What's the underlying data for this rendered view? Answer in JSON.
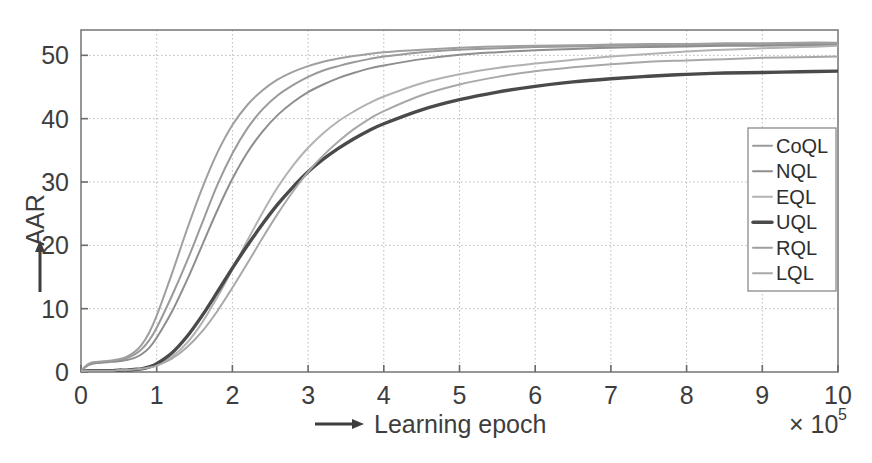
{
  "figure": {
    "title": "",
    "y_axis_label": "AAR",
    "x_axis_label": "Learning epoch",
    "x_multiplier_base": "× 10",
    "x_multiplier_exponent": "5",
    "arrow_y_icon": "up-arrow-icon",
    "arrow_x_icon": "right-arrow-icon"
  },
  "legend": {
    "position": "upper-right-inside",
    "entries": [
      {
        "label": "CoQL",
        "color": "#9a9a9a",
        "width": 2.0
      },
      {
        "label": "NQL",
        "color": "#8e8e8e",
        "width": 2.0
      },
      {
        "label": "EQL",
        "color": "#b2b2b2",
        "width": 2.0
      },
      {
        "label": "UQL",
        "color": "#4a4a4a",
        "width": 3.4
      },
      {
        "label": "RQL",
        "color": "#9f9f9f",
        "width": 2.0
      },
      {
        "label": "LQL",
        "color": "#a8a8a8",
        "width": 2.0
      }
    ]
  },
  "chart_data": {
    "type": "line",
    "title": "",
    "xlabel": "Learning epoch",
    "ylabel": "AAR",
    "xlim": [
      0,
      10
    ],
    "ylim": [
      0,
      54
    ],
    "xticks": [
      0,
      1,
      2,
      3,
      4,
      5,
      6,
      7,
      8,
      9,
      10
    ],
    "yticks": [
      0,
      10,
      20,
      30,
      40,
      50
    ],
    "xtick_labels": [
      "0",
      "1",
      "2",
      "3",
      "4",
      "5",
      "6",
      "7",
      "8",
      "9",
      "10"
    ],
    "ytick_labels": [
      "0",
      "10",
      "20",
      "30",
      "40",
      "50"
    ],
    "x_unit_multiplier": "x 10^5",
    "grid": true,
    "grid_style": "dotted",
    "legend_position": "upper right",
    "x": [
      0,
      0.1,
      0.2,
      0.3,
      0.4,
      0.5,
      0.6,
      0.7,
      0.8,
      0.9,
      1.0,
      1.2,
      1.4,
      1.6,
      1.8,
      2.0,
      2.2,
      2.4,
      2.6,
      2.8,
      3.0,
      3.2,
      3.4,
      3.6,
      3.8,
      4.0,
      4.5,
      5.0,
      5.5,
      6.0,
      6.5,
      7.0,
      7.5,
      8.0,
      8.5,
      9.0,
      9.5,
      10.0
    ],
    "series": [
      {
        "name": "CoQL",
        "color": "#9a9a9a",
        "values": [
          0.2,
          1.2,
          1.5,
          1.6,
          1.7,
          1.9,
          2.2,
          2.7,
          3.6,
          5.0,
          7.0,
          12.0,
          17.5,
          23.5,
          29.5,
          34.5,
          38.5,
          41.5,
          43.7,
          45.3,
          46.6,
          47.6,
          48.3,
          48.9,
          49.4,
          49.8,
          50.5,
          50.9,
          51.1,
          51.3,
          51.4,
          51.5,
          51.6,
          51.6,
          51.7,
          51.7,
          51.8,
          51.8
        ]
      },
      {
        "name": "NQL",
        "color": "#8e8e8e",
        "values": [
          0.2,
          1.1,
          1.4,
          1.5,
          1.6,
          1.7,
          1.9,
          2.2,
          2.8,
          3.8,
          5.4,
          9.5,
          14.5,
          20.0,
          25.5,
          30.5,
          34.7,
          38.0,
          40.6,
          42.6,
          44.2,
          45.4,
          46.4,
          47.2,
          47.9,
          48.4,
          49.4,
          50.1,
          50.5,
          50.8,
          51.0,
          51.2,
          51.3,
          51.4,
          51.5,
          51.5,
          51.6,
          51.6
        ]
      },
      {
        "name": "EQL",
        "color": "#b2b2b2",
        "values": [
          0.1,
          0.2,
          0.2,
          0.2,
          0.2,
          0.3,
          0.3,
          0.4,
          0.5,
          0.7,
          1.1,
          2.4,
          4.6,
          7.8,
          11.8,
          16.2,
          20.8,
          25.2,
          29.2,
          32.6,
          35.4,
          37.7,
          39.6,
          41.1,
          42.4,
          43.5,
          45.6,
          47.0,
          48.0,
          48.7,
          49.3,
          49.8,
          50.2,
          50.6,
          50.9,
          51.1,
          51.3,
          51.5
        ]
      },
      {
        "name": "UQL",
        "color": "#4a4a4a",
        "values": [
          0.1,
          0.2,
          0.2,
          0.2,
          0.2,
          0.3,
          0.3,
          0.4,
          0.5,
          0.8,
          1.3,
          3.0,
          5.6,
          8.9,
          12.6,
          16.4,
          20.0,
          23.4,
          26.5,
          29.2,
          31.6,
          33.6,
          35.3,
          36.8,
          38.1,
          39.2,
          41.4,
          43.0,
          44.2,
          45.1,
          45.8,
          46.3,
          46.7,
          47.0,
          47.2,
          47.3,
          47.4,
          47.5
        ]
      },
      {
        "name": "RQL",
        "color": "#9f9f9f",
        "values": [
          0.2,
          1.3,
          1.6,
          1.7,
          1.8,
          2.0,
          2.4,
          3.1,
          4.3,
          6.2,
          8.9,
          15.5,
          22.5,
          29.0,
          34.6,
          39.0,
          42.2,
          44.5,
          46.2,
          47.4,
          48.3,
          49.0,
          49.5,
          49.9,
          50.2,
          50.5,
          50.9,
          51.2,
          51.4,
          51.5,
          51.6,
          51.7,
          51.8,
          51.8,
          51.9,
          51.9,
          52.0,
          52.0
        ]
      },
      {
        "name": "LQL",
        "color": "#a8a8a8",
        "values": [
          0.1,
          0.2,
          0.2,
          0.2,
          0.2,
          0.3,
          0.3,
          0.4,
          0.5,
          0.7,
          1.0,
          2.1,
          3.9,
          6.4,
          9.6,
          13.3,
          17.2,
          21.2,
          25.0,
          28.5,
          31.6,
          34.2,
          36.4,
          38.3,
          39.9,
          41.2,
          43.7,
          45.4,
          46.6,
          47.5,
          48.1,
          48.6,
          49.0,
          49.2,
          49.4,
          49.6,
          49.7,
          49.8
        ]
      }
    ]
  },
  "geometry": {
    "plot_left": 81,
    "plot_right": 838,
    "plot_top": 30,
    "plot_bottom": 372
  }
}
